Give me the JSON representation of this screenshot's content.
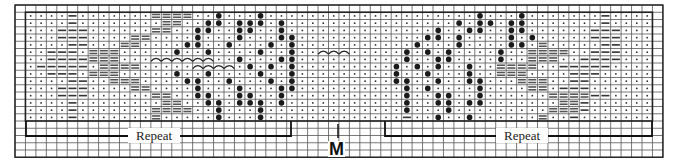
{
  "chart_title": "Knitting stitch chart",
  "grid": {
    "origin_x": 15,
    "origin_y": 5,
    "cell_w": 10.45,
    "cell_h": 7.25,
    "cols": 62,
    "rows": 21,
    "pattern_col_offset": 1,
    "pattern_row_offset": 1,
    "line_color": "#555555",
    "border_color": "#222222"
  },
  "legend_symbols": {
    ".": "dot",
    "-": "single-dash",
    "=": "double-dash",
    "o": "filled-circle",
    "c": "cable-arc"
  },
  "pattern_rows": [
    "....-.......====..o...o....................o...o.......-....",
    "....-........==..oo.ooo.o................o.oo.oo.......-....",
    "...---......==..oo..oo..o..............o..oo..oo......---...",
    "...---....==....o...o...oo............oo.o....o.o.....---...",
    "....--...==....oo..o...o.o...........o...o....oo.=.....--...",
    "..---.===.....o..o....o..o..ccc.....o.o.o....o..====..---...",
    "..----===...cccccc..o...oo..........o..oo....o..===..----...",
    ".-----.====.....cccc.o.o.o.........o.o.o..o..====..-----....",
    "..---.===.....o..o....o..o.........o..o...o..===....---.....",
    "....--..===....oo..o...o.o.........oo..o..oo...===..--......",
    "...---....==....o...o...oo..........o.o....o....==.---......",
    "...---......==..oo..oo..o...........o..oo..o......====--....",
    "....-........==..oo.ooo.o...........o..oo.oo.......==-......",
    "....-.......====..o...o.............o...o.........===-......",
    "....-.......=.....o...o.............-..o..o......=..-......."
  ],
  "labels": {
    "repeat_left": "Repeat",
    "repeat_right": "Repeat",
    "center_marker": "M"
  },
  "brackets": {
    "left": {
      "x1": 26,
      "x2": 291,
      "y": 136
    },
    "right": {
      "x1": 385,
      "x2": 652,
      "y": 136
    },
    "center_tick": {
      "x": 338,
      "y1": 124,
      "y2": 138
    }
  },
  "colors": {
    "dot": "#333333",
    "dash": "#333333",
    "double_dash": "#555555",
    "circle": "#1a1a1a",
    "arc": "#222222"
  }
}
